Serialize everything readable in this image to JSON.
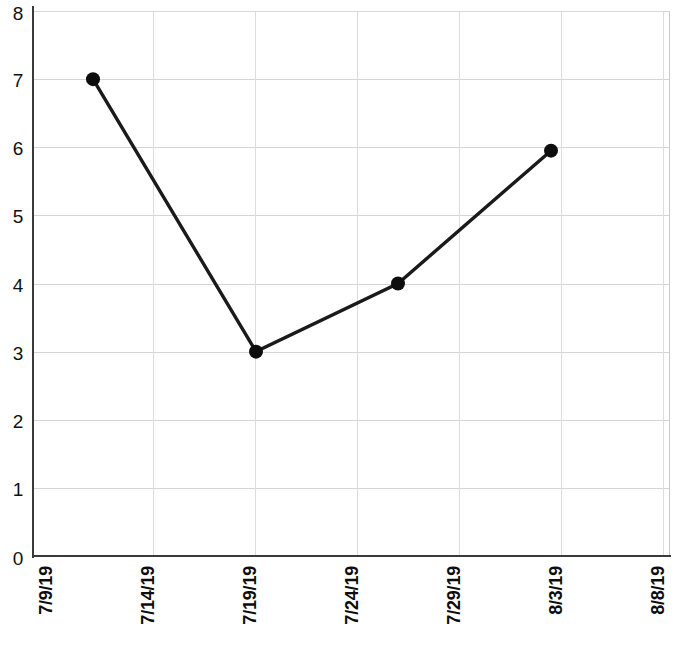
{
  "chart_data": {
    "type": "line",
    "title": "",
    "subtitle": "",
    "xlabel": "",
    "ylabel": "",
    "x_tick_labels": [
      "7/9/19",
      "7/14/19",
      "7/19/19",
      "7/24/19",
      "7/29/19",
      "8/3/19",
      "8/8/19"
    ],
    "y_tick_labels": [
      "8",
      "7",
      "6",
      "5",
      "4",
      "3",
      "2",
      "1",
      "0"
    ],
    "ylim": [
      0,
      8
    ],
    "y_ticks": [
      0,
      1,
      2,
      3,
      4,
      5,
      6,
      7,
      8
    ],
    "grid": "both",
    "legend": "none",
    "series": [
      {
        "name": "series-1",
        "color": "#1a1a1a",
        "marker": "circle",
        "x": [
          "7/11/19",
          "7/19/19",
          "7/26/19",
          "8/3/19"
        ],
        "values": [
          7,
          3,
          4,
          5.95
        ]
      }
    ],
    "points": [
      {
        "x_label": "7/11/19",
        "x_px": 93,
        "y_value": 7
      },
      {
        "x_label": "7/19/19",
        "x_px": 256,
        "y_value": 3
      },
      {
        "x_label": "7/26/19",
        "x_px": 398,
        "y_value": 4
      },
      {
        "x_label": "8/3/19",
        "x_px": 551,
        "y_value": 5.95
      }
    ],
    "colors": {
      "line": "#1a1a1a",
      "marker": "#0d0d0d",
      "grid": "#d5d5d5",
      "axis": "#3a3a3a",
      "background": "#ffffff",
      "tick_text": "#111111"
    }
  },
  "axis": {
    "x_tick_px": [
      46,
      148,
      250,
      352,
      454,
      556,
      658
    ],
    "plot_left_px": 34,
    "plot_right_px": 670,
    "plot_top_px": 11,
    "plot_bottom_px": 556
  }
}
